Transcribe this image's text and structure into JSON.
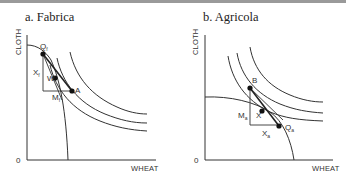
{
  "panels": [
    {
      "title": "a. Fabrica",
      "y_axis_label": "CLOTH",
      "x_axis_label": "WHEAT",
      "origin_label": "0",
      "points": {
        "production": "Qf",
        "consumption": "A",
        "intermediate": "W"
      },
      "triangle_labels": {
        "vertical": "Xf",
        "horizontal": "Mf"
      }
    },
    {
      "title": "b. Agricola",
      "y_axis_label": "CLOTH",
      "x_axis_label": "WHEAT",
      "origin_label": "0",
      "points": {
        "consumption": "B",
        "intermediate": "X",
        "production": "Qa"
      },
      "triangle_labels": {
        "vertical": "Ma",
        "horizontal": "Xa"
      }
    }
  ],
  "labels": {
    "a_Q_main": "Q",
    "a_Q_sub": "f",
    "a_X_main": "X",
    "a_X_sub": "f",
    "a_M_main": "M",
    "a_M_sub": "f",
    "a_W": "W",
    "a_A": "A",
    "b_B": "B",
    "b_M_main": "M",
    "b_M_sub": "a",
    "b_X": "X",
    "b_Xa_main": "X",
    "b_Xa_sub": "a",
    "b_Q_main": "Q",
    "b_Q_sub": "a"
  }
}
